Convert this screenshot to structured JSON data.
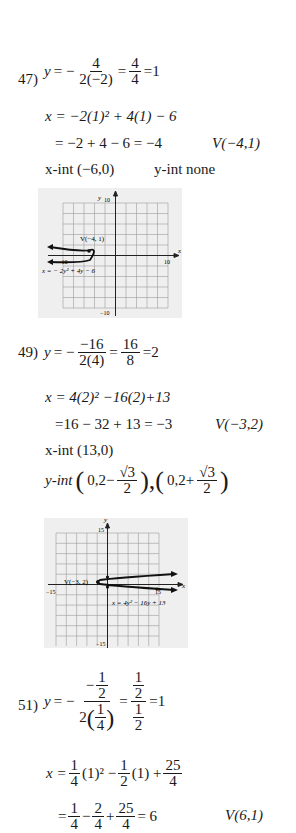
{
  "problems": [
    {
      "number": "47)",
      "vertex_y_line": {
        "lhs": "y",
        "eq": "= −",
        "num": "4",
        "den": "2(−2)",
        "eq2": "=",
        "num2": "4",
        "den2": "4",
        "result": "=1"
      },
      "x_line1": "x = −2(1)² + 4(1) − 6",
      "x_line2": "= −2 + 4 − 6 = −4",
      "vertex": "V(−4,1)",
      "x_int": "x-int (−6,0)",
      "y_int": "y-int none",
      "graph": {
        "y_label": "y",
        "x_label": "x",
        "y_max": "10",
        "y_min": "−10",
        "x_max": "10",
        "x_min": "−10",
        "vertex_label": "V(−4, 1)",
        "equation_label": "x = − 2y² + 4y − 6"
      }
    },
    {
      "number": "49)",
      "vertex_y_line": {
        "lhs": "y",
        "eq": "= −",
        "num": "−16",
        "den": "2(4)",
        "eq2": "=",
        "num2": "16",
        "den2": "8",
        "result": "=2"
      },
      "x_line1": "x = 4(2)² −16(2)+13",
      "x_line2": "=16 − 32 + 13 = −3",
      "vertex": "V(−3,2)",
      "x_int": "x-int (13,0)",
      "y_int": {
        "label": "y-int",
        "p1_pre": "0,2−",
        "p2_pre": "0,2+",
        "num": "√3",
        "den": "2"
      },
      "graph": {
        "y_label": "y",
        "x_label": "x",
        "y_max": "15",
        "y_min": "−15",
        "x_max": "15",
        "x_min": "−15",
        "vertex_label": "V(−3, 2)",
        "equation_label": "x = 4y² − 16y + 13"
      }
    },
    {
      "number": "51)",
      "vertex_y_line": {
        "lhs": "y",
        "eq": "= −",
        "inner_num": "1",
        "inner_den": "2",
        "den_coef": "2",
        "den_num": "1",
        "den_den": "4",
        "eq2": "=",
        "r_num_num": "1",
        "r_num_den": "2",
        "r_den_num": "1",
        "r_den_den": "2",
        "result": "=1"
      },
      "x_line1": {
        "pre": "x =",
        "a_num": "1",
        "a_den": "4",
        "t1": "(1)² −",
        "b_num": "1",
        "b_den": "2",
        "t2": "(1) +",
        "c_num": "25",
        "c_den": "4"
      },
      "x_line2": {
        "pre": "=",
        "a_num": "1",
        "a_den": "4",
        "op1": "−",
        "b_num": "2",
        "b_den": "4",
        "op2": "+",
        "c_num": "25",
        "c_den": "4",
        "result": "= 6"
      },
      "vertex": "V(6,1)"
    }
  ]
}
